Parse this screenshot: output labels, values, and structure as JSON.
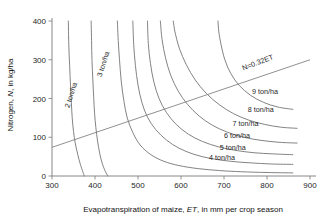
{
  "chart_data": {
    "type": "line",
    "title": "",
    "subtitle": "",
    "xlabel_parts": {
      "pre": "Evapotranspiration of maize, ",
      "italic": "ET",
      "post": ", in mm per crop season"
    },
    "xlabel": "Evapotranspiration of maize, ET, in mm per crop season",
    "ylabel_parts": {
      "pre": "Nitrogen, ",
      "italic": "N",
      "post": ", in kg/ha"
    },
    "ylabel": "Nitrogen, N, in kg/ha",
    "xlim": [
      300,
      900
    ],
    "ylim": [
      0,
      400
    ],
    "xticks": [
      300,
      400,
      500,
      600,
      700,
      800,
      900
    ],
    "yticks": [
      0,
      100,
      200,
      300,
      400
    ],
    "grid": false,
    "legend_position": "inline-curve-labels",
    "series": [
      {
        "name": "2 ton/ha",
        "label": "2 ton/ha",
        "label_x": 340,
        "label_y": 175,
        "label_rotation": -72,
        "points": [
          [
            375,
            0
          ],
          [
            372,
            10
          ],
          [
            366,
            30
          ],
          [
            360,
            55
          ],
          [
            354,
            85
          ],
          [
            350,
            115
          ],
          [
            347,
            150
          ],
          [
            345,
            190
          ],
          [
            343,
            235
          ],
          [
            341,
            285
          ],
          [
            339,
            340
          ],
          [
            338,
            400
          ]
        ]
      },
      {
        "name": "3 ton/ha",
        "label": "3 ton/ha",
        "label_x": 415,
        "label_y": 255,
        "label_rotation": -72,
        "points": [
          [
            430,
            0
          ],
          [
            424,
            12
          ],
          [
            417,
            32
          ],
          [
            411,
            58
          ],
          [
            406,
            90
          ],
          [
            402,
            125
          ],
          [
            399,
            162
          ],
          [
            397,
            202
          ],
          [
            395,
            248
          ],
          [
            393,
            298
          ],
          [
            392,
            350
          ],
          [
            391,
            400
          ]
        ]
      },
      {
        "name": "4 ton/ha",
        "label": "4 ton/ha",
        "label_x": 665,
        "label_y": 42,
        "label_rotation": 0,
        "points": [
          [
            860,
            8
          ],
          [
            800,
            9
          ],
          [
            740,
            11
          ],
          [
            690,
            14
          ],
          [
            640,
            19
          ],
          [
            595,
            27
          ],
          [
            560,
            38
          ],
          [
            530,
            55
          ],
          [
            505,
            80
          ],
          [
            488,
            112
          ],
          [
            475,
            150
          ],
          [
            467,
            195
          ],
          [
            461,
            245
          ],
          [
            457,
            300
          ],
          [
            454,
            350
          ],
          [
            452,
            400
          ]
        ]
      },
      {
        "name": "5 ton/ha",
        "label": "5 ton/ha",
        "label_x": 690,
        "label_y": 66,
        "label_rotation": 0,
        "points": [
          [
            860,
            30
          ],
          [
            810,
            31
          ],
          [
            760,
            34
          ],
          [
            715,
            38
          ],
          [
            670,
            45
          ],
          [
            630,
            56
          ],
          [
            595,
            72
          ],
          [
            566,
            93
          ],
          [
            541,
            120
          ],
          [
            522,
            152
          ],
          [
            509,
            190
          ],
          [
            500,
            235
          ],
          [
            494,
            285
          ],
          [
            490,
            340
          ],
          [
            488,
            400
          ]
        ]
      },
      {
        "name": "6 ton/ha",
        "label": "6 ton/ha",
        "label_x": 700,
        "label_y": 98,
        "label_rotation": 0,
        "points": [
          [
            860,
            55
          ],
          [
            815,
            57
          ],
          [
            770,
            60
          ],
          [
            728,
            66
          ],
          [
            688,
            75
          ],
          [
            650,
            89
          ],
          [
            617,
            108
          ],
          [
            589,
            133
          ],
          [
            566,
            164
          ],
          [
            549,
            200
          ],
          [
            537,
            242
          ],
          [
            529,
            290
          ],
          [
            524,
            342
          ],
          [
            522,
            400
          ]
        ]
      },
      {
        "name": "7 ton/ha",
        "label": "7 ton/ha",
        "label_x": 720,
        "label_y": 128,
        "label_rotation": 0,
        "points": [
          [
            870,
            85
          ],
          [
            828,
            87
          ],
          [
            786,
            92
          ],
          [
            746,
            100
          ],
          [
            708,
            113
          ],
          [
            673,
            131
          ],
          [
            642,
            155
          ],
          [
            615,
            185
          ],
          [
            593,
            220
          ],
          [
            576,
            260
          ],
          [
            564,
            305
          ],
          [
            556,
            352
          ],
          [
            552,
            400
          ]
        ]
      },
      {
        "name": "8 ton/ha",
        "label": "8 ton/ha",
        "label_x": 755,
        "label_y": 165,
        "label_rotation": 0,
        "points": [
          [
            870,
            123
          ],
          [
            832,
            126
          ],
          [
            795,
            133
          ],
          [
            758,
            144
          ],
          [
            722,
            161
          ],
          [
            689,
            184
          ],
          [
            659,
            213
          ],
          [
            633,
            248
          ],
          [
            612,
            288
          ],
          [
            596,
            330
          ],
          [
            586,
            372
          ],
          [
            582,
            400
          ]
        ]
      },
      {
        "name": "9 ton/ha",
        "label": "9 ton/ha",
        "label_x": 765,
        "label_y": 212,
        "label_rotation": 0,
        "points": [
          [
            860,
            172
          ],
          [
            825,
            178
          ],
          [
            792,
            190
          ],
          [
            762,
            208
          ],
          [
            736,
            233
          ],
          [
            716,
            264
          ],
          [
            702,
            300
          ],
          [
            693,
            340
          ],
          [
            688,
            372
          ],
          [
            686,
            400
          ]
        ]
      }
    ],
    "reference_line": {
      "name": "N=0.32ET",
      "label": "N=0.32ET",
      "equation_slope": 0.32,
      "x_start": 300,
      "y_start": 74,
      "x_end": 900,
      "y_end": 300,
      "label_x": 745,
      "label_y": 272,
      "label_rotation": -21
    }
  }
}
